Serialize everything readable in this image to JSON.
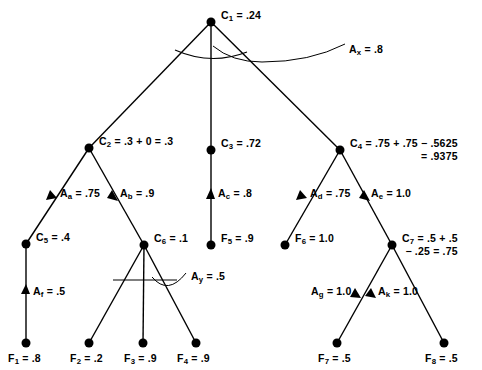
{
  "diagram": {
    "colors": {
      "ink": "#000000",
      "background": "#ffffff"
    },
    "nodes": [
      {
        "id": "C1",
        "sym": "C",
        "sub": "1",
        "text": "C₁ = .24",
        "line1": " = .24",
        "line2": "",
        "x": 211,
        "y": 22,
        "lx": 221,
        "ly": 9
      },
      {
        "id": "C2",
        "sym": "C",
        "sub": "2",
        "text": "C₂ = .3 + 0 = .3",
        "line1": " = .3 + 0 = .3",
        "line2": "",
        "x": 89,
        "y": 148,
        "lx": 99,
        "ly": 135
      },
      {
        "id": "C3",
        "sym": "C",
        "sub": "3",
        "text": "C₃ = .72",
        "line1": " = .72",
        "line2": "",
        "x": 211,
        "y": 150,
        "lx": 221,
        "ly": 137
      },
      {
        "id": "C4",
        "sym": "C",
        "sub": "4",
        "text": "C₄ = .75 + .75 − .5625 = .9375",
        "line1": " = .75 + .75 − .5625",
        "line2": "= .9375",
        "x": 340,
        "y": 150,
        "lx": 350,
        "ly": 137
      },
      {
        "id": "C5",
        "sym": "C",
        "sub": "5",
        "text": "C₅ = .4",
        "line1": " = .4",
        "line2": "",
        "x": 26,
        "y": 244,
        "lx": 36,
        "ly": 231
      },
      {
        "id": "C6",
        "sym": "C",
        "sub": "6",
        "text": "C₆ = .1",
        "line1": " = .1",
        "line2": "",
        "x": 144,
        "y": 245,
        "lx": 154,
        "ly": 232
      },
      {
        "id": "C7",
        "sym": "C",
        "sub": "7",
        "text": "C₇ = .5 + .5 − .25 = .75",
        "line1": " = .5 + .5",
        "line2": "− .25 = .75",
        "x": 392,
        "y": 245,
        "lx": 402,
        "ly": 232
      },
      {
        "id": "F5",
        "sym": "F",
        "sub": "5",
        "text": "F₅ = .9",
        "line1": " = .9",
        "line2": "",
        "x": 211,
        "y": 245,
        "lx": 221,
        "ly": 232
      },
      {
        "id": "F6",
        "sym": "F",
        "sub": "6",
        "text": "F₆ = 1.0",
        "line1": " = 1.0",
        "line2": "",
        "x": 285,
        "y": 245,
        "lx": 295,
        "ly": 232
      },
      {
        "id": "F1",
        "sym": "F",
        "sub": "1",
        "text": "F₁ = .8",
        "line1": " = .8",
        "line2": "",
        "x": 26,
        "y": 343,
        "lx": 8,
        "ly": 352
      },
      {
        "id": "F2",
        "sym": "F",
        "sub": "2",
        "text": "F₂ = .2",
        "line1": " = .2",
        "line2": "",
        "x": 89,
        "y": 343,
        "lx": 70,
        "ly": 352
      },
      {
        "id": "F3",
        "sym": "F",
        "sub": "3",
        "text": "F₃ = .9",
        "line1": " = .9",
        "line2": "",
        "x": 143,
        "y": 343,
        "lx": 124,
        "ly": 352
      },
      {
        "id": "F4",
        "sym": "F",
        "sub": "4",
        "text": "F₄ = .9",
        "line1": " = .9",
        "line2": "",
        "x": 196,
        "y": 343,
        "lx": 177,
        "ly": 352
      },
      {
        "id": "F7",
        "sym": "F",
        "sub": "7",
        "text": "F₇ = .5",
        "line1": " = .5",
        "line2": "",
        "x": 337,
        "y": 343,
        "lx": 318,
        "ly": 352
      },
      {
        "id": "F8",
        "sym": "F",
        "sub": "8",
        "text": "F₈ = .5",
        "line1": " = .5",
        "line2": "",
        "x": 444,
        "y": 343,
        "lx": 425,
        "ly": 352
      }
    ],
    "arc_labels": [
      {
        "id": "Ax",
        "sym": "A",
        "sub": "x",
        "text": "Aₓ = .8",
        "line1": " = .8",
        "lx": 349,
        "ly": 43
      },
      {
        "id": "Ay",
        "sym": "A",
        "sub": "y",
        "text": "Aᵧ = .5",
        "line1": " = .5",
        "lx": 191,
        "ly": 270
      }
    ],
    "edge_labels": [
      {
        "id": "Aa",
        "sym": "A",
        "sub": "a",
        "text": "Aₐ = .75",
        "line1": " = .75",
        "lx": 60,
        "ly": 187
      },
      {
        "id": "Ab",
        "sym": "A",
        "sub": "b",
        "text": "A₇ = .9",
        "line1": " = .9",
        "lx": 120,
        "ly": 187
      },
      {
        "id": "Ac",
        "sym": "A",
        "sub": "c",
        "text": "Aᶜ = .8",
        "line1": " = .8",
        "lx": 218,
        "ly": 187
      },
      {
        "id": "Ad",
        "sym": "A",
        "sub": "d",
        "text": "Aᵈ = .75",
        "line1": " = .75",
        "lx": 310,
        "ly": 187
      },
      {
        "id": "Ae",
        "sym": "A",
        "sub": "e",
        "text": "Aₑ = 1.0",
        "line1": " = 1.0",
        "lx": 371,
        "ly": 187
      },
      {
        "id": "Af",
        "sym": "A",
        "sub": "f",
        "text": "A_f = .5",
        "line1": " = .5",
        "lx": 33,
        "ly": 285
      },
      {
        "id": "Ag",
        "sym": "A",
        "sub": "g",
        "text": "Ag = 1.0",
        "line1": " = 1.0",
        "lx": 319,
        "ly": 285
      },
      {
        "id": "Ak",
        "sym": "A",
        "sub": "k",
        "text": "A_k = 1.0",
        "line1": " = 1.0",
        "lx": 411,
        "ly": 285
      }
    ],
    "edges": [
      {
        "from": "C1",
        "to": "C2"
      },
      {
        "from": "C1",
        "to": "C3"
      },
      {
        "from": "C1",
        "to": "C4"
      },
      {
        "from": "C2",
        "to": "C5"
      },
      {
        "from": "C2",
        "to": "C6"
      },
      {
        "from": "C3",
        "to": "F5"
      },
      {
        "from": "C4",
        "to": "F6"
      },
      {
        "from": "C4",
        "to": "C7"
      },
      {
        "from": "C5",
        "to": "F1"
      },
      {
        "from": "C6",
        "to": "F2"
      },
      {
        "from": "C6",
        "to": "F3"
      },
      {
        "from": "C6",
        "to": "F4"
      },
      {
        "from": "C7",
        "to": "F7"
      },
      {
        "from": "C7",
        "to": "F8"
      }
    ]
  }
}
